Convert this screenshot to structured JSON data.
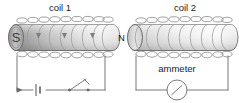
{
  "diagram": {
    "background": "#ffffff",
    "line_color": "#5a5a5a",
    "text_color": "#1b1b1b",
    "coil_wire_color": "#7a7a7a"
  },
  "labels": {
    "coil1": "coil 1",
    "coil2": "coil 2",
    "ammeter": "ammeter",
    "pole_south": "S",
    "pole_north": "N"
  },
  "coil1": {
    "name": "coil 1",
    "label": "coil 1",
    "has_magnet": true,
    "magnet_poles": [
      "S",
      "N"
    ],
    "field_arrows": 3,
    "winding_turns": 13
  },
  "coil2": {
    "name": "coil 2",
    "label": "coil 2",
    "has_magnet": false,
    "winding_turns": 13
  },
  "circuit1": {
    "name": "primary-circuit",
    "components": [
      "battery",
      "switch"
    ],
    "battery_symbol": "cell",
    "switch_state": "open",
    "current_arrow": "up"
  },
  "circuit2": {
    "name": "secondary-circuit",
    "components": [
      "ammeter"
    ],
    "meter_label": "ammeter",
    "meter_symbol": "circle-with-needle"
  }
}
